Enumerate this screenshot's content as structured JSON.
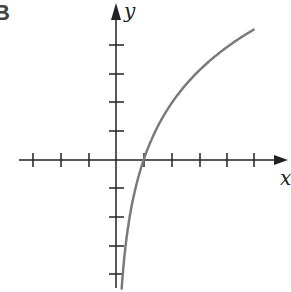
{
  "panel_label": "B",
  "axes": {
    "x_label": "x",
    "y_label": "y",
    "x_ticks_negative": 3,
    "x_ticks_positive": 5,
    "y_ticks_positive": 4,
    "y_ticks_negative": 4
  },
  "curve": {
    "description": "logarithmic curve y = 3 ln(x), passing through (1, 0), vertical asymptote at x = 0",
    "color": "#7a7a7a"
  },
  "colors": {
    "axis": "#222222",
    "curve": "#7a7a7a"
  }
}
